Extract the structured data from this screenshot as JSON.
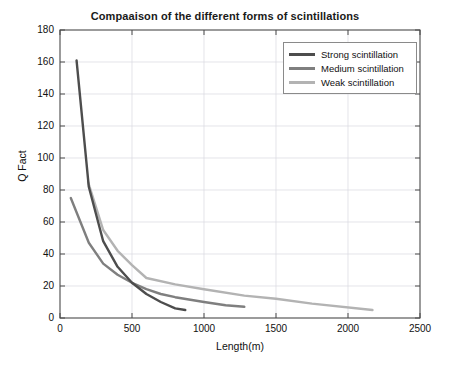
{
  "chart_data": {
    "type": "line",
    "title": "Compaaison of the different forms of scintillations",
    "xlabel": "Length(m)",
    "ylabel": "Q Fact",
    "xlim": [
      0,
      2500
    ],
    "ylim": [
      0,
      180
    ],
    "xticks": [
      0,
      500,
      1000,
      1500,
      2000,
      2500
    ],
    "yticks": [
      0,
      20,
      40,
      60,
      80,
      100,
      120,
      140,
      160,
      180
    ],
    "grid": true,
    "legend_position": "upper right",
    "series": [
      {
        "name": "Strong scintillation",
        "color": "#4d4d4d",
        "x": [
          115,
          200,
          300,
          400,
          500,
          600,
          700,
          800,
          870
        ],
        "y": [
          161,
          82,
          48,
          32,
          22,
          15,
          10,
          6,
          5
        ]
      },
      {
        "name": "Medium scintillation",
        "color": "#7f7f7f",
        "x": [
          75,
          200,
          300,
          400,
          500,
          600,
          700,
          800,
          1000,
          1150,
          1280
        ],
        "y": [
          75,
          47,
          34,
          27,
          22,
          18,
          15,
          13,
          10,
          8,
          7
        ]
      },
      {
        "name": "Weak scintillation",
        "color": "#b3b3b3",
        "x": [
          195,
          300,
          400,
          500,
          600,
          800,
          1000,
          1280,
          1500,
          1750,
          2170
        ],
        "y": [
          85,
          55,
          42,
          33,
          25,
          21,
          18,
          14,
          12,
          9,
          5
        ]
      }
    ]
  },
  "legend": {
    "items": [
      {
        "label": "Strong scintillation",
        "color": "#4d4d4d"
      },
      {
        "label": "Medium scintillation",
        "color": "#7f7f7f"
      },
      {
        "label": "Weak scintillation",
        "color": "#b3b3b3"
      }
    ]
  },
  "colors": {
    "axis": "#4a4a4a",
    "grid": "#d9d9e0",
    "background": "#ffffff",
    "text": "#111111"
  }
}
